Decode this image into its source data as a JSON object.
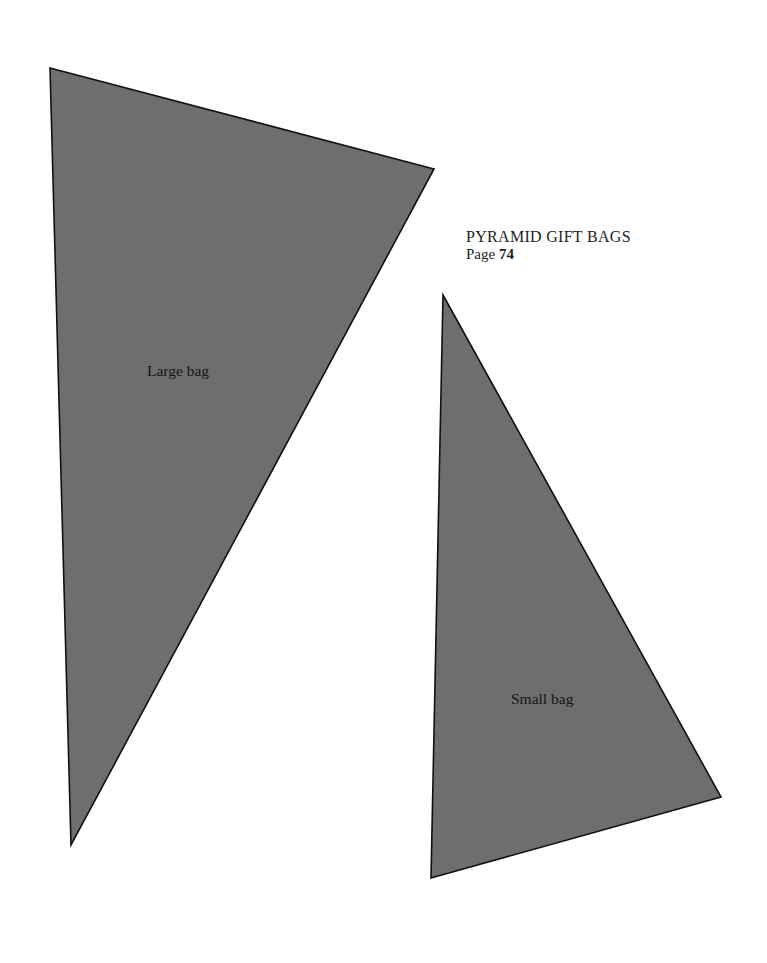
{
  "heading": {
    "title": "PYRAMID GIFT BAGS",
    "page_prefix": "Page",
    "page_number": "74"
  },
  "templates": [
    {
      "id": "large",
      "label": "Large bag"
    },
    {
      "id": "small",
      "label": "Small bag"
    }
  ],
  "colors": {
    "template_fill": "#6e6e6e",
    "outline": "#111111",
    "background": "#ffffff"
  }
}
